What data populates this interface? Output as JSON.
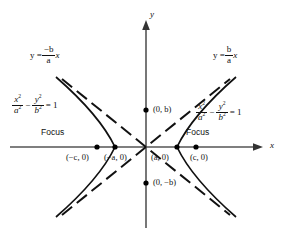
{
  "figure": {
    "axes": {
      "x_label": "x",
      "y_label": "y"
    },
    "colors": {
      "axis": "#555555",
      "curve": "#111111",
      "asymptote": "#111111",
      "point": "#000000",
      "background": "#ffffff"
    },
    "equations": {
      "left": {
        "num1": "x",
        "den1": "a",
        "num2": "y",
        "den2": "b",
        "minus": "−",
        "equals": "= 1",
        "exp": "2"
      },
      "right": {
        "num1": "x",
        "den1": "a",
        "num2": "y",
        "den2": "b",
        "minus": "−",
        "equals": "= 1",
        "exp": "2"
      }
    },
    "asymptotes": {
      "left": {
        "lhs": "y =",
        "num": "−b",
        "den": "a",
        "var": "x"
      },
      "right": {
        "lhs": "y =",
        "num": "b",
        "den": "a",
        "var": "x"
      }
    },
    "points": [
      {
        "name": "left-focus",
        "label": "(−c, 0)",
        "focus_tag": "Focus"
      },
      {
        "name": "left-vertex",
        "label": "(−a, 0)"
      },
      {
        "name": "right-vertex",
        "label": "(a, 0)"
      },
      {
        "name": "right-focus",
        "label": "(c, 0)",
        "focus_tag": "Focus"
      },
      {
        "name": "top-covertex",
        "label": "(0, b)"
      },
      {
        "name": "bottom-covertex",
        "label": "(0, −b)"
      }
    ],
    "labels": {
      "left_focus": "(−c, 0)",
      "left_vertex": "(−a, 0)",
      "right_vertex": "(a, 0)",
      "right_focus": "(c, 0)",
      "top_covertex": "(0, b)",
      "bottom_covertex": "(0, −b)",
      "focus_left": "Focus",
      "focus_right": "Focus"
    }
  }
}
